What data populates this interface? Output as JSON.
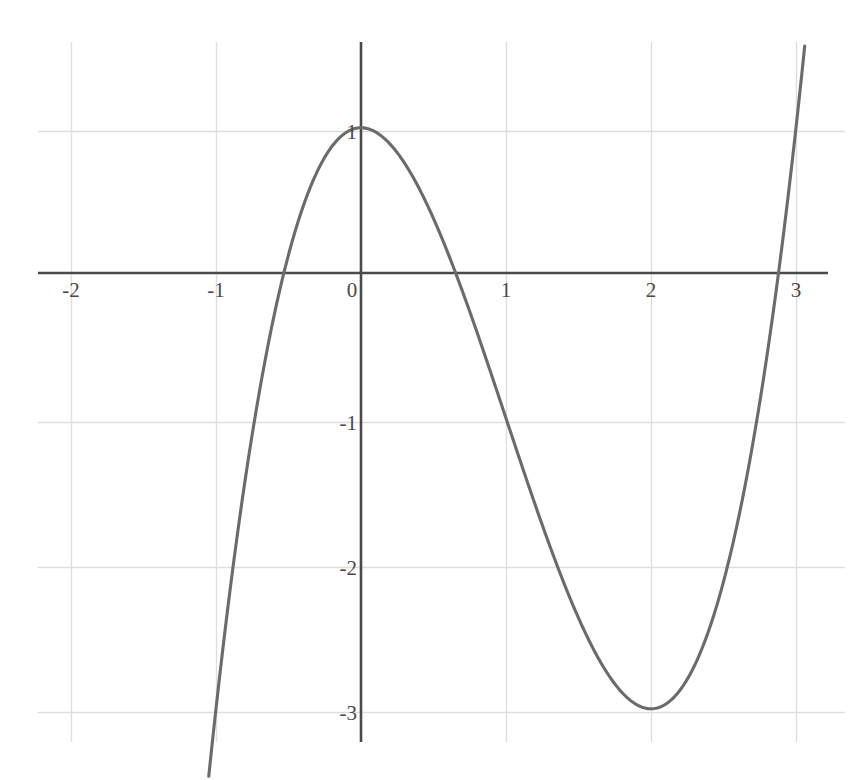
{
  "chart_data": {
    "type": "line",
    "title": "",
    "subtitle": "",
    "xlabel": "",
    "ylabel": "",
    "function": "x^3 - 3x^2 + 1",
    "xlim": [
      -2.49,
      3.42
    ],
    "ylim": [
      -3.48,
      1.59
    ],
    "x_ticks": [
      -2,
      -1,
      0,
      1,
      2,
      3
    ],
    "x_tick_labels": [
      "-2",
      "-1",
      "0",
      "1",
      "2",
      "3"
    ],
    "y_ticks": [
      1,
      -1,
      -2,
      -3
    ],
    "y_tick_labels": [
      "1",
      "-1",
      "-2",
      "-3"
    ],
    "grid": true,
    "legend": "none",
    "domain_plotted": [
      -1.05,
      3.06
    ],
    "annotations": [],
    "series": [
      {
        "name": "f(x) = x^3 - 3x^2 + 1",
        "x": [
          -1.05,
          -1.0,
          -0.9,
          -0.8,
          -0.7,
          -0.6,
          -0.52,
          -0.4,
          -0.3,
          -0.2,
          -0.1,
          0.0,
          0.1,
          0.2,
          0.3,
          0.4,
          0.5,
          0.6,
          0.65,
          0.8,
          1.0,
          1.2,
          1.4,
          1.5,
          1.6,
          1.8,
          2.0,
          2.2,
          2.4,
          2.5,
          2.6,
          2.8,
          2.879,
          3.0,
          3.06
        ],
        "y": [
          -3.468,
          -3.0,
          -2.159,
          -1.432,
          -0.813,
          -0.296,
          0.047,
          0.456,
          0.703,
          0.872,
          0.969,
          1.0,
          0.971,
          0.888,
          0.757,
          0.584,
          0.375,
          0.136,
          0.007,
          -0.408,
          -1.0,
          -1.592,
          -2.136,
          -2.375,
          -2.584,
          -2.888,
          -3.0,
          -2.872,
          -2.544,
          -2.25,
          -1.896,
          -1.432,
          -1.0,
          1.0,
          1.593
        ]
      }
    ],
    "key_points": {
      "local_maximum": [
        0,
        1
      ],
      "local_minimum": [
        2,
        -3
      ],
      "x_intercepts": [
        -0.532,
        0.653,
        2.879
      ],
      "y_intercept": [
        0,
        1
      ]
    },
    "colors": {
      "curve": "#6b6b6b",
      "axis": "#4a4a4a",
      "grid": "#dedede",
      "tick_text": "#4a4a4a",
      "background": "#ffffff"
    }
  }
}
